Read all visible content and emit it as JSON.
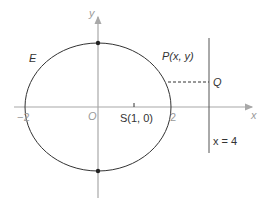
{
  "diagram": {
    "curve_label": "E",
    "point_label": "P(x, y)",
    "q_label": "Q",
    "focus_label": "S(1, 0)",
    "directrix_label": "x = 4",
    "axes": {
      "x_label": "x",
      "y_label": "y",
      "origin_label": "O",
      "tick_neg": "−2",
      "tick_pos": "2"
    },
    "colors": {
      "curve": "#333333",
      "axis": "#a8a8a8",
      "text": "#333333",
      "axis_text": "#9a9a9a"
    }
  }
}
